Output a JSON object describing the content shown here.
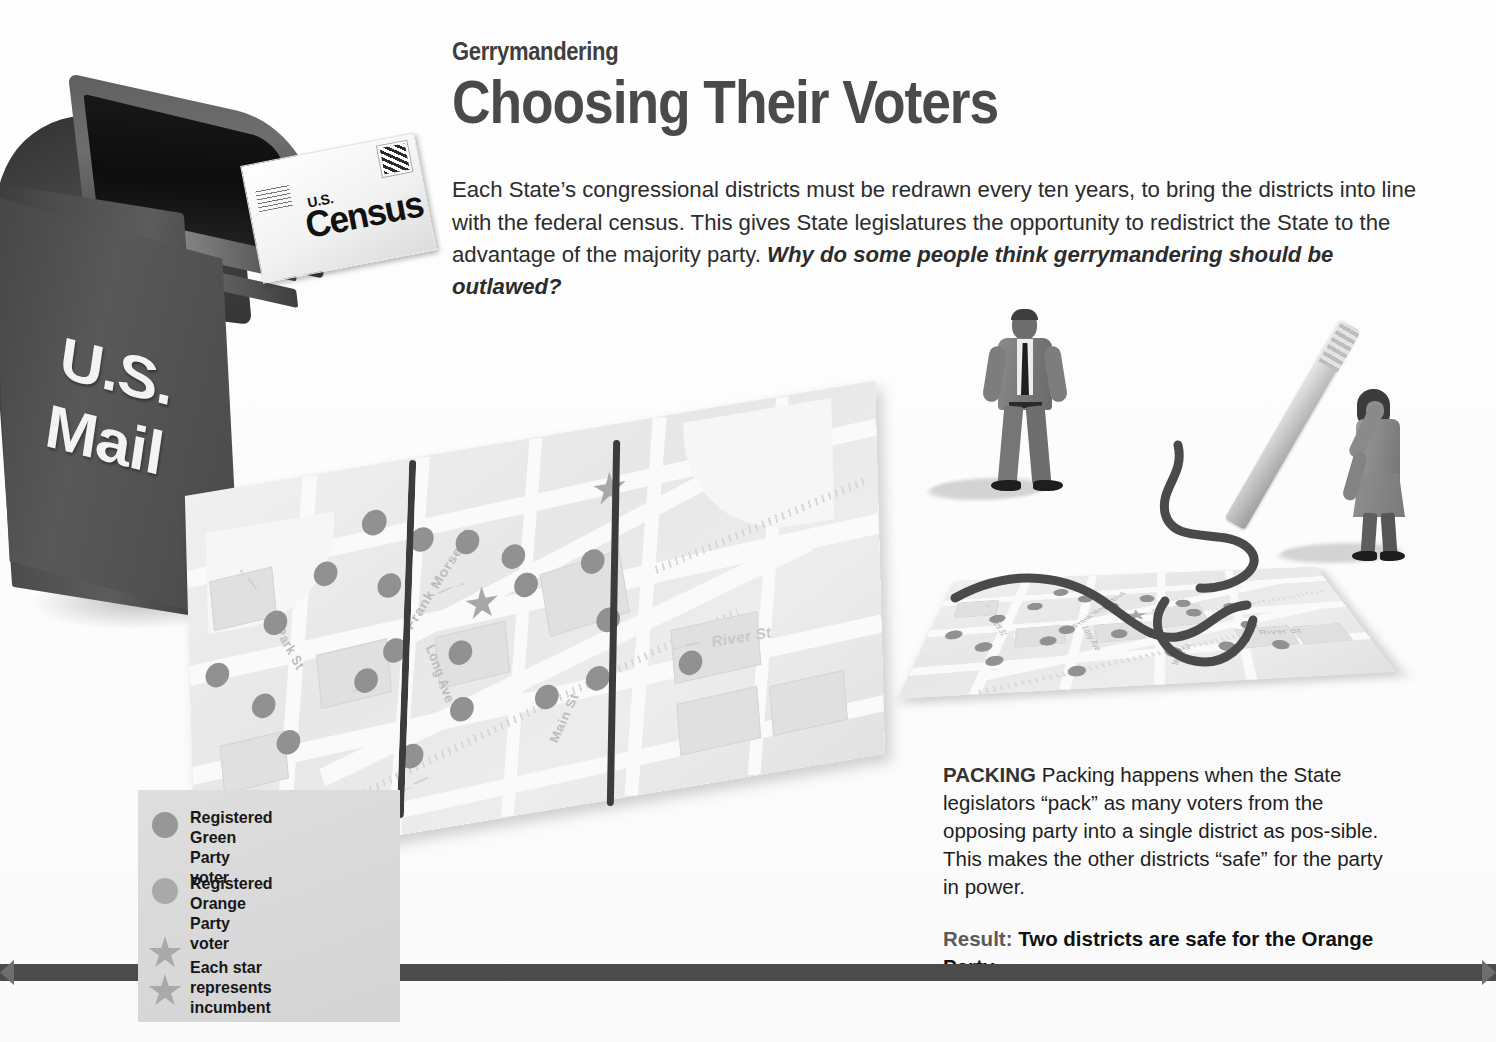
{
  "article": {
    "kicker": "Gerrymandering",
    "headline": "Choosing Their Voters",
    "deck_plain": "Each State’s congressional districts must be redrawn every ten years, to bring the districts into line with the federal census. This gives State legislatures the opportunity to redistrict the State to the advantage of the majority party. ",
    "deck_question": "Why do some people think gerrymandering should be outlawed?"
  },
  "mailbox": {
    "line1": "U.S.",
    "line2": "Mail",
    "label_name": "us-mail-box"
  },
  "envelope": {
    "small_line": "U.S.",
    "big_line": "Census",
    "stamp_name": "postage-stamp-icon",
    "address_name": "return-address-lines"
  },
  "maps": {
    "left": {
      "name": "original-district-map",
      "streets": [
        {
          "label": "Park St"
        },
        {
          "label": "Frank Morse Bl"
        },
        {
          "label": "Long Ave"
        },
        {
          "label": "Main St"
        },
        {
          "label": "River St"
        },
        {
          "label": "Ho"
        }
      ],
      "arrows": [
        "←",
        "→",
        "←",
        "←"
      ],
      "green_dot_count": 18,
      "orange_dot_count": 0,
      "star_count": 2
    },
    "right": {
      "name": "repacked-district-map",
      "streets": [
        {
          "label": "Park St"
        },
        {
          "label": "Frank Morse Blvd"
        },
        {
          "label": "Long Ave"
        },
        {
          "label": "Main St"
        },
        {
          "label": "River St"
        }
      ],
      "star_count": 2,
      "district_boundary_style": "hand-drawn-squiggle"
    }
  },
  "figures": [
    {
      "name": "legislator-man",
      "pose": "hands-on-hips",
      "attire": "gray suit, dark tie"
    },
    {
      "name": "legislator-woman",
      "pose": "drawing-with-giant-marker",
      "attire": "gray dress"
    }
  ],
  "packing": {
    "lead": "PACKING",
    "body": " Packing happens when the State legislators “pack” as many voters from the opposing party into a single district as pos-sible. This makes the other districts “safe” for the party in power.",
    "result_label": "Result:",
    "result_text": " Two districts are safe for the Orange Party."
  },
  "legend": {
    "items": [
      {
        "marker": "dot-green",
        "label": "Registered Green\nParty voter"
      },
      {
        "marker": "dot-orange",
        "label": "Registered Orange\nParty voter"
      },
      {
        "marker": "star-pair",
        "label": "Each star represents\nincumbent"
      }
    ]
  },
  "colors": {
    "headline": "#4a4a4a",
    "body_text": "#1e1e1e",
    "legend_panel": "#dadada",
    "green_voter_dot": "#919191",
    "orange_voter_dot": "#a3a3a3",
    "incumbent_star": "#a8a8a8",
    "district_line": "#3c3c3c",
    "bottom_rule": "#4b4b4b",
    "map_paper": "#ededed"
  }
}
